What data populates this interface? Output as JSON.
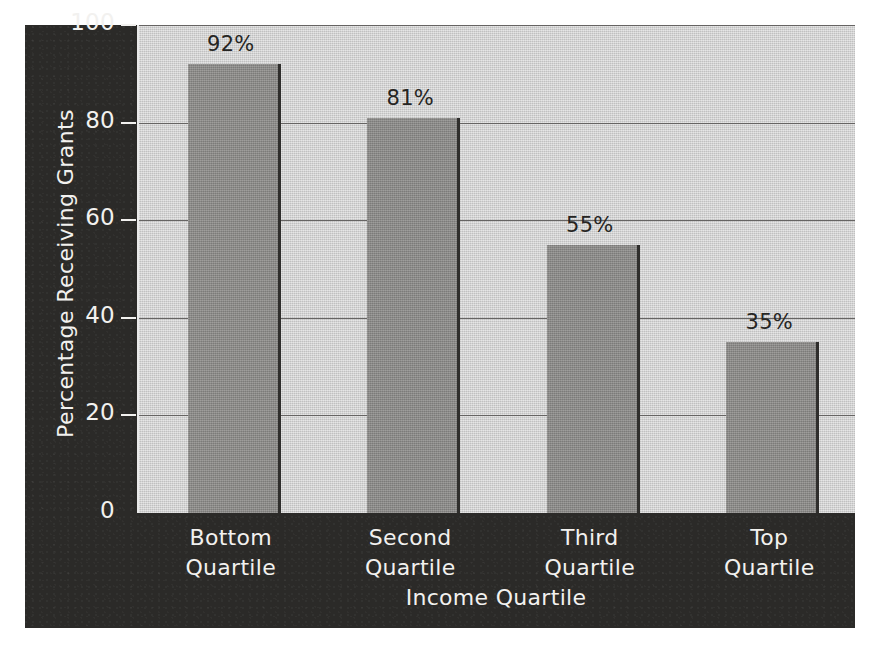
{
  "chart_data": {
    "type": "bar",
    "title": "",
    "categories": [
      "Bottom Quartile",
      "Second Quartile",
      "Third Quartile",
      "Top Quartile"
    ],
    "category_lines": [
      [
        "Bottom",
        "Quartile"
      ],
      [
        "Second",
        "Quartile"
      ],
      [
        "Third",
        "Quartile"
      ],
      [
        "Top",
        "Quartile"
      ]
    ],
    "values": [
      92,
      81,
      55,
      35
    ],
    "value_labels": [
      "92%",
      "81%",
      "55%",
      "35%"
    ],
    "xlabel": "Income Quartile",
    "ylabel": "Percentage Receiving Grants",
    "ylim": [
      0,
      100
    ],
    "yticks": [
      100,
      80,
      60,
      40,
      20,
      0
    ],
    "ytick_labels": [
      "100",
      "80",
      "60",
      "40",
      "20",
      "0"
    ],
    "grid": true,
    "legend": null,
    "colors": {
      "panel_background": "#2b2a28",
      "plot_background": "#cdcdcd",
      "bar_fill": "#8b8a88",
      "bar_edge": "#2f2e2c",
      "gridline": "#666463",
      "axis_text": "#f2f1ef",
      "value_label_text": "#262523",
      "page_background": "#ffffff"
    }
  }
}
